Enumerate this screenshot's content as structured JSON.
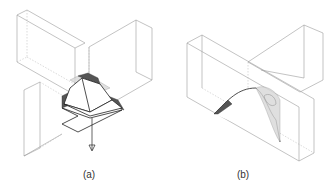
{
  "figure": {
    "panels": [
      {
        "id": "a",
        "caption": "(a)",
        "description": "Cross-shaped beam joint with a pyramidal cut piece being removed downward (arrow)"
      },
      {
        "id": "b",
        "caption": "(b)",
        "description": "T-shaped beam joint with an arched cut surface"
      }
    ],
    "colors": {
      "outline": "#9a9a9a",
      "cut_edge": "#222222",
      "shading": "#555555"
    }
  }
}
